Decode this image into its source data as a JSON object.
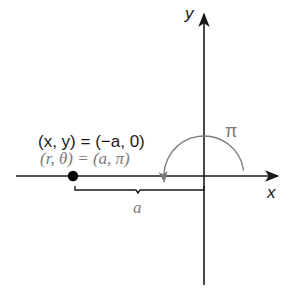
{
  "diagram": {
    "axes": {
      "x_label": "x",
      "y_label": "y"
    },
    "point": {
      "cartesian_label": "(x, y) = (−a, 0)",
      "polar_label": "(r, θ) = (a, π)"
    },
    "angle_label": "π",
    "distance_label": "a",
    "colors": {
      "axis": "#1a1a1a",
      "primary_text": "#1a1a1a",
      "secondary": "#7a7a7a",
      "point": "#000000",
      "background": "#ffffff"
    }
  }
}
